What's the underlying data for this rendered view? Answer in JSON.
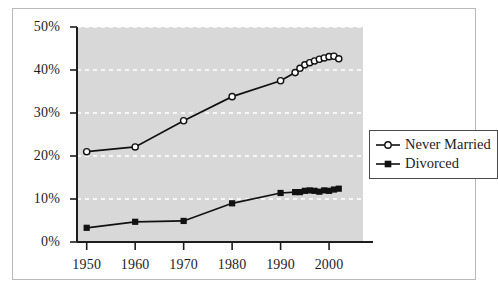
{
  "chart_data": {
    "type": "line",
    "title": "",
    "subtitle": "",
    "xlabel": "",
    "ylabel": "",
    "xlim": [
      1948,
      2007
    ],
    "ylim": [
      0,
      50
    ],
    "xticks": [
      1950,
      1960,
      1970,
      1980,
      1990,
      2000
    ],
    "xtick_labels": [
      "1950",
      "1960",
      "1970",
      "1980",
      "1990",
      "2000"
    ],
    "yticks": [
      0,
      10,
      20,
      30,
      40,
      50
    ],
    "ytick_labels": [
      "0%",
      "10%",
      "20%",
      "30%",
      "40%",
      "50%"
    ],
    "grid": "horizontal-dashed-white",
    "plot_background": "#d8d8d8",
    "legend_position": "right",
    "series": [
      {
        "name": "Never Married",
        "marker": "open-circle",
        "color": "#111111",
        "x": [
          1950,
          1960,
          1970,
          1980,
          1990,
          1993,
          1994,
          1995,
          1996,
          1997,
          1998,
          1999,
          2000,
          2001,
          2002
        ],
        "values": [
          21.0,
          22.1,
          28.2,
          33.8,
          37.5,
          39.4,
          40.4,
          41.2,
          41.7,
          42.1,
          42.5,
          42.8,
          43.1,
          43.2,
          42.6
        ]
      },
      {
        "name": "Divorced",
        "marker": "filled-square",
        "color": "#111111",
        "x": [
          1950,
          1960,
          1970,
          1980,
          1990,
          1993,
          1994,
          1995,
          1996,
          1997,
          1998,
          1999,
          2000,
          2001,
          2002
        ],
        "values": [
          3.3,
          4.7,
          4.9,
          9.0,
          11.4,
          11.6,
          11.6,
          11.9,
          12.0,
          11.9,
          11.7,
          12.0,
          11.9,
          12.2,
          12.4
        ]
      }
    ]
  },
  "legend": {
    "items": [
      {
        "label": "Never Married",
        "marker": "open-circle"
      },
      {
        "label": "Divorced",
        "marker": "filled-square"
      }
    ]
  }
}
